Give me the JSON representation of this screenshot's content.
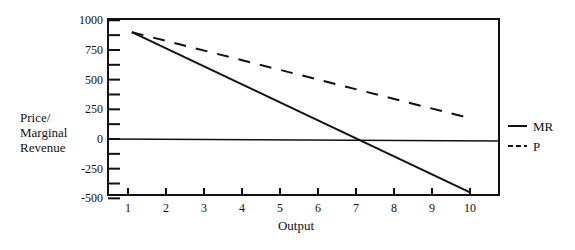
{
  "chart_data": {
    "type": "line",
    "title": "",
    "xlabel": "Output",
    "ylabel": "Price/ Marginal Revenue",
    "ylabel_lines": [
      "Price/",
      "Marginal",
      "Revenue"
    ],
    "x_ticks": [
      1,
      2,
      3,
      4,
      5,
      6,
      7,
      8,
      9,
      10
    ],
    "y_ticks": [
      1000,
      750,
      500,
      250,
      0,
      -250,
      -500
    ],
    "y_minor_ticks": [
      875,
      625,
      375,
      125,
      -125,
      -375
    ],
    "xlim": [
      0.25,
      10.7
    ],
    "ylim": [
      -500,
      1000
    ],
    "grid": false,
    "zero_line": true,
    "legend_position": "right",
    "series": [
      {
        "name": "MR",
        "style": "solid",
        "x": [
          1.1,
          10
        ],
        "values": [
          900,
          -450
        ]
      },
      {
        "name": "P",
        "style": "dashed",
        "x": [
          1.1,
          10
        ],
        "values": [
          900,
          175
        ]
      }
    ]
  },
  "legend": {
    "items": [
      {
        "label": "MR",
        "style": "solid"
      },
      {
        "label": "P",
        "style": "dashed"
      }
    ]
  }
}
